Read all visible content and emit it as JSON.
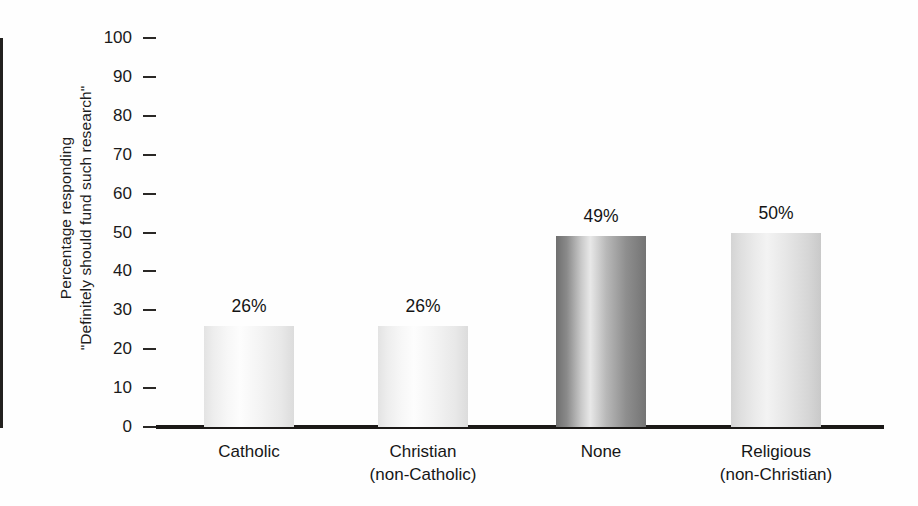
{
  "chart_data": {
    "type": "bar",
    "title": "",
    "subtitle": "",
    "xlabel": "",
    "ylabel_line1": "Percentage responding",
    "ylabel_line2": "\"Definitely should fund such research\"",
    "categories": [
      "Catholic",
      "Christian\n(non-Catholic)",
      "None",
      "Religious\n(non-Christian)"
    ],
    "category_lines": [
      {
        "line1": "Catholic",
        "line2": ""
      },
      {
        "line1": "Christian",
        "line2": "(non-Catholic)"
      },
      {
        "line1": "None",
        "line2": ""
      },
      {
        "line1": "Religious",
        "line2": "(non-Christian)"
      }
    ],
    "values": [
      26,
      26,
      49,
      50
    ],
    "value_labels": [
      "26%",
      "26%",
      "49%",
      "50%"
    ],
    "ylim": [
      0,
      100
    ],
    "ytick_values": [
      0,
      10,
      20,
      30,
      40,
      50,
      60,
      70,
      80,
      90,
      100
    ],
    "ytick_labels": [
      "0",
      "10",
      "20",
      "30",
      "40",
      "50",
      "60",
      "70",
      "80",
      "90",
      "100"
    ],
    "grid": false,
    "legend": "none",
    "bar_styles": [
      "light",
      "light",
      "dark",
      "mid"
    ],
    "colors": {
      "bar_light": "#f2f2f2",
      "bar_dark": "#8e8e8e",
      "bar_mid": "#e2e2e2",
      "axis": "#1b1917",
      "text": "#161616",
      "background": "#fefefe"
    }
  }
}
